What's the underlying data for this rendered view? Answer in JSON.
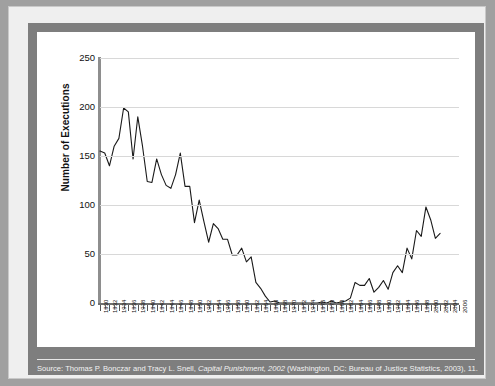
{
  "figure": {
    "caption_prefix": "Source: Thomas P. Bonczar and Tracy L. Snell, ",
    "caption_italic": "Capital Punishment, 2002",
    "caption_suffix": " (Washington, DC: Bureau of Justice Statistics, 2003), 11."
  },
  "colors": {
    "frame": "#a0a0a0",
    "page": "#efefef",
    "mat": "#7e7e7e",
    "card": "#ffffff",
    "line": "#1a1a1a",
    "grid": "#d8d8d8",
    "axis": "#8e8e8e",
    "caption_text": "#f2f2f2"
  },
  "chart_data": {
    "type": "line",
    "title": "",
    "xlabel": "",
    "ylabel": "Number of Executions",
    "ylim": [
      0,
      250
    ],
    "yticks": [
      0,
      50,
      100,
      150,
      200,
      250
    ],
    "xlim": [
      1930,
      2006
    ],
    "grid": true,
    "legend": "none",
    "xtick_step": 2,
    "xticks": [
      "1930",
      "1932",
      "1934",
      "1936",
      "1938",
      "1940",
      "1942",
      "1944",
      "1946",
      "1948",
      "1950",
      "1952",
      "1954",
      "1956",
      "1958",
      "1960",
      "1962",
      "1964",
      "1966",
      "1968",
      "1970",
      "1972",
      "1974",
      "1976",
      "1978",
      "1980",
      "1982",
      "1984",
      "1986",
      "1988",
      "1990",
      "1992",
      "1994",
      "1996",
      "1998",
      "2000",
      "2002",
      "2004",
      "2006"
    ],
    "x": [
      1930,
      1931,
      1932,
      1933,
      1934,
      1935,
      1936,
      1937,
      1938,
      1939,
      1940,
      1941,
      1942,
      1943,
      1944,
      1945,
      1946,
      1947,
      1948,
      1949,
      1950,
      1951,
      1952,
      1953,
      1954,
      1955,
      1956,
      1957,
      1958,
      1959,
      1960,
      1961,
      1962,
      1963,
      1964,
      1965,
      1966,
      1967,
      1968,
      1969,
      1970,
      1971,
      1972,
      1973,
      1974,
      1975,
      1976,
      1977,
      1978,
      1979,
      1980,
      1981,
      1982,
      1983,
      1984,
      1985,
      1986,
      1987,
      1988,
      1989,
      1990,
      1991,
      1992,
      1993,
      1994,
      1995,
      1996,
      1997,
      1998,
      1999,
      2000,
      2001,
      2002
    ],
    "values": [
      155,
      153,
      140,
      160,
      168,
      199,
      195,
      147,
      190,
      160,
      124,
      123,
      147,
      131,
      120,
      117,
      131,
      153,
      119,
      119,
      82,
      105,
      83,
      62,
      81,
      76,
      65,
      65,
      49,
      49,
      56,
      42,
      47,
      21,
      15,
      7,
      1,
      2,
      0,
      0,
      0,
      0,
      0,
      0,
      0,
      0,
      0,
      1,
      0,
      2,
      0,
      1,
      2,
      5,
      21,
      18,
      18,
      25,
      11,
      16,
      23,
      14,
      31,
      38,
      31,
      56,
      45,
      74,
      68,
      98,
      85,
      66,
      71
    ],
    "series_name": "Executions in the United States"
  }
}
